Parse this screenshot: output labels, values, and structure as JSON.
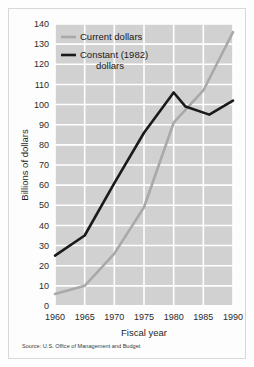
{
  "figure": {
    "source_note": "Source: U.S. Office of Management and Budget",
    "background_color": "#ffffff",
    "plot_background_color": "#d1d1d1",
    "gridline_color": "#ffffff"
  },
  "chart_data": {
    "type": "line",
    "title": "",
    "xlabel": "Fiscal year",
    "ylabel": "Billions of dollars",
    "xlim": [
      1960,
      1990
    ],
    "ylim": [
      0,
      140
    ],
    "xticks": [
      1960,
      1965,
      1970,
      1975,
      1980,
      1985,
      1990
    ],
    "xtick_labels": [
      "1960",
      "1965",
      "1970",
      "1975",
      "1980",
      "1985",
      "1990"
    ],
    "yticks": [
      0,
      10,
      20,
      30,
      40,
      50,
      60,
      70,
      80,
      90,
      100,
      110,
      120,
      130,
      140
    ],
    "ytick_labels": [
      "0",
      "10",
      "20",
      "30",
      "40",
      "50",
      "60",
      "70",
      "80",
      "90",
      "100",
      "110",
      "120",
      "130",
      "140"
    ],
    "grid": true,
    "legend_position": "upper-left-inside",
    "x": [
      1960,
      1965,
      1970,
      1975,
      1980,
      1982,
      1986,
      1990
    ],
    "series": [
      {
        "name": "Current dollars",
        "color": "#a9a9a9",
        "x": [
          1960,
          1965,
          1970,
          1975,
          1980,
          1985,
          1990
        ],
        "values": [
          6,
          10,
          26,
          49,
          91,
          107,
          136
        ]
      },
      {
        "name": "Constant (1982) dollars",
        "color": "#1a1a1a",
        "x": [
          1960,
          1965,
          1970,
          1975,
          1980,
          1982,
          1986,
          1990
        ],
        "values": [
          25,
          35,
          61,
          86,
          106,
          99,
          95,
          102
        ]
      }
    ]
  },
  "legend": {
    "items": [
      {
        "label": "Current dollars",
        "color": "#a9a9a9"
      },
      {
        "label": "Constant (1982)",
        "label_line2": "dollars",
        "color": "#1a1a1a"
      }
    ]
  }
}
